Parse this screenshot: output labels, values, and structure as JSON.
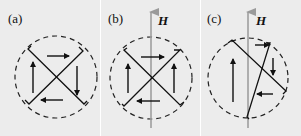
{
  "figure": {
    "panels": [
      {
        "label": "(a)",
        "field": null
      },
      {
        "label": "(b)",
        "field": "H"
      },
      {
        "label": "(c)",
        "field": "H"
      }
    ]
  },
  "colors": {
    "background": "#ececec",
    "ink": "#111111",
    "field_axis": "#9a9a9a",
    "gap": "#ffffff"
  }
}
